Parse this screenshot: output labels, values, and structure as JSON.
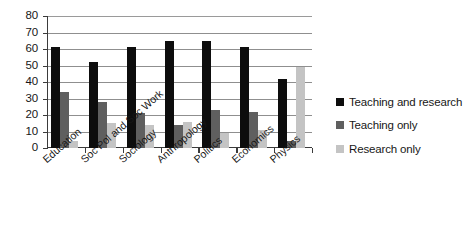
{
  "chart_data": {
    "type": "bar",
    "title": "",
    "subtitle": "",
    "xlabel": "",
    "ylabel": "",
    "ylim": [
      0,
      80
    ],
    "y_ticks": [
      0,
      10,
      20,
      30,
      40,
      50,
      60,
      70,
      80
    ],
    "grid": true,
    "grid_axis": "y",
    "legend_position": "right",
    "orientation": "vertical",
    "grouping": "grouped",
    "categories": [
      "Education",
      "Soc Pol and Soc Work",
      "Sociology",
      "Anthropology",
      "Politics",
      "Economics",
      "Physics"
    ],
    "series": [
      {
        "name": "Teaching and research",
        "color": "#0d0d0d",
        "values": [
          61,
          52,
          61,
          65,
          65,
          61,
          42
        ]
      },
      {
        "name": "Teaching only",
        "color": "#5f5f5f",
        "values": [
          34,
          28,
          21,
          14,
          23,
          22,
          4
        ]
      },
      {
        "name": "Research only",
        "color": "#c4c4c4",
        "values": [
          4,
          15,
          14,
          16,
          9,
          11,
          49
        ]
      }
    ],
    "annotations": []
  },
  "axis": {
    "y_tick_labels": [
      "80",
      "70",
      "60",
      "50",
      "40",
      "30",
      "20",
      "10",
      "0"
    ]
  },
  "legend": {
    "entries": [
      {
        "label": "Teaching and research",
        "color": "#0d0d0d"
      },
      {
        "label": "Teaching only",
        "color": "#5f5f5f"
      },
      {
        "label": "Research only",
        "color": "#c4c4c4"
      }
    ]
  },
  "colors": {
    "axis": "#3b3b3b",
    "grid": "#8f8f8f",
    "text": "#171717",
    "background": "#ffffff"
  }
}
